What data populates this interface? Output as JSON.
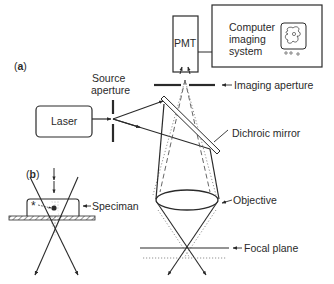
{
  "diagram": {
    "type": "confocal microscope schematic",
    "panel_a": {
      "label_open": "(",
      "label_letter": "a",
      "label_close": ")",
      "components": {
        "laser": "Laser",
        "source_aperture_line1": "Source",
        "source_aperture_line2": "aperture",
        "pmt": "PMT",
        "computer_line1": "Computer",
        "computer_line2": "imaging",
        "computer_line3": "system",
        "imaging_aperture": "Imaging aperture",
        "dichroic_mirror": "Dichroic mirror",
        "objective": "Objective",
        "focal_plane": "Focal plane"
      }
    },
    "panel_b": {
      "label_open": "(",
      "label_letter": "b",
      "label_close": ")",
      "specimen": "Speciman",
      "marker": "*"
    },
    "colors": {
      "line": "#2a2a2a",
      "dashed": "#555555",
      "dotted": "#777777",
      "background": "#ffffff"
    }
  }
}
